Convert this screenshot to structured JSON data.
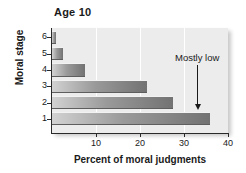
{
  "chart_data": {
    "type": "bar",
    "orientation": "horizontal",
    "title": "Age 10",
    "xlabel": "Percent of moral judgments",
    "ylabel": "Moral stage",
    "categories": [
      "6",
      "5",
      "4",
      "3",
      "2",
      "1"
    ],
    "values": [
      1,
      2.5,
      7.5,
      21.5,
      27.5,
      36
    ],
    "xlim": [
      0,
      40
    ],
    "xticks": [
      10,
      20,
      30,
      40
    ],
    "xtick_labels": [
      "10",
      "20",
      "30",
      "40"
    ],
    "grid": "vertical",
    "legend": "none",
    "annotations": [
      {
        "text": "Mostly low",
        "x": 33,
        "points_to_category": "1"
      }
    ],
    "colors": {
      "plot_background": "#ececec",
      "bar_light": "#d2d2d2",
      "bar_dark": "#727272",
      "gridline": "#ffffff",
      "axis": "#2a2a2a",
      "text": "#1a1a1a"
    }
  }
}
